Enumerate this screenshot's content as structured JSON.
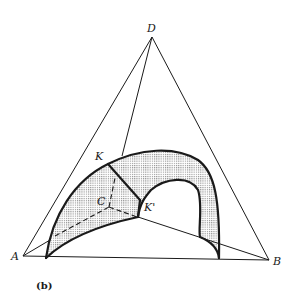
{
  "figure": {
    "caption": "(b)",
    "labels": {
      "A": "A",
      "B": "B",
      "C": "C",
      "D": "D",
      "K": "K",
      "K_prime": "K'"
    },
    "colors": {
      "ink": "#1a1a1a",
      "shading": "#bdbdbd",
      "background": "#ffffff"
    }
  }
}
